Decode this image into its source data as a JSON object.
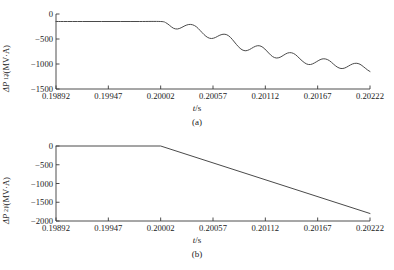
{
  "figure": {
    "panels": [
      {
        "id": "a",
        "caption": "(a)",
        "ylabel_prefix": "ΔP",
        "ylabel_sub": "12",
        "ylabel_suffix": "/(MV·A)",
        "xlabel_italic": "t",
        "xlabel_rest": "/s"
      },
      {
        "id": "b",
        "caption": "(b)",
        "ylabel_prefix": "ΔP",
        "ylabel_sub": "21",
        "ylabel_suffix": "/(MV·A)",
        "xlabel_italic": "t",
        "xlabel_rest": "/s"
      }
    ]
  },
  "chart_data": [
    {
      "type": "line",
      "panel": "a",
      "title": "",
      "xlabel": "t/s",
      "ylabel": "ΔP12/(MV·A)",
      "xlim": [
        0.19892,
        0.20222
      ],
      "ylim": [
        -1500,
        0
      ],
      "xticks": [
        "0.19892",
        "0.19947",
        "0.20002",
        "0.20057",
        "0.20112",
        "0.20167",
        "0.20222"
      ],
      "xtick_values": [
        0.19892,
        0.19947,
        0.20002,
        0.20057,
        0.20112,
        0.20167,
        0.20222
      ],
      "yticks": [
        "0",
        "-500",
        "-1000",
        "-1500"
      ],
      "ytick_values": [
        0,
        -500,
        -1000,
        -1500
      ],
      "grid": false,
      "legend": "none",
      "series": [
        {
          "name": "ΔP12",
          "description": "Flat at about -150 MV·A until t = 0.20002 s, then a damped oscillation superimposed on a downward ramp reaching about -1150 MV·A at t = 0.20222 s",
          "x": [
            0.19892,
            0.199,
            0.1992,
            0.1994,
            0.1996,
            0.1998,
            0.20002,
            0.200075,
            0.200115,
            0.200155,
            0.200195,
            0.200235,
            0.200275,
            0.200315,
            0.200355,
            0.200395,
            0.200435,
            0.200475,
            0.200515,
            0.200555,
            0.200595,
            0.200635,
            0.200675,
            0.200715,
            0.200755,
            0.200795,
            0.200835,
            0.200875,
            0.200915,
            0.200955,
            0.200995,
            0.201035,
            0.201075,
            0.201115,
            0.201155,
            0.201195,
            0.201235,
            0.201275,
            0.201315,
            0.201355,
            0.201395,
            0.201435,
            0.201475,
            0.201515,
            0.201555,
            0.201595,
            0.201635,
            0.201675,
            0.201715,
            0.201755,
            0.201795,
            0.201835,
            0.201875,
            0.201915,
            0.201955,
            0.201995,
            0.202035,
            0.202075,
            0.202115,
            0.202155,
            0.202195,
            0.20222
          ],
          "y": [
            -150,
            -150,
            -150,
            -150,
            -150,
            -150,
            -150,
            -175,
            -230,
            -285,
            -300,
            -275,
            -235,
            -210,
            -215,
            -255,
            -330,
            -410,
            -470,
            -490,
            -470,
            -430,
            -405,
            -415,
            -470,
            -560,
            -650,
            -715,
            -735,
            -710,
            -665,
            -635,
            -645,
            -700,
            -780,
            -850,
            -880,
            -865,
            -820,
            -780,
            -775,
            -810,
            -880,
            -950,
            -1000,
            -1010,
            -980,
            -935,
            -900,
            -900,
            -935,
            -1000,
            -1060,
            -1090,
            -1080,
            -1040,
            -1000,
            -985,
            -1005,
            -1060,
            -1120,
            -1150
          ]
        }
      ]
    },
    {
      "type": "line",
      "panel": "b",
      "title": "",
      "xlabel": "t/s",
      "ylabel": "ΔP21/(MV·A)",
      "xlim": [
        0.19892,
        0.20222
      ],
      "ylim": [
        -2000,
        0
      ],
      "xticks": [
        "0.19892",
        "0.19947",
        "0.20002",
        "0.20057",
        "0.20112",
        "0.20167",
        "0.20222"
      ],
      "xtick_values": [
        0.19892,
        0.19947,
        0.20002,
        0.20057,
        0.20112,
        0.20167,
        0.20222
      ],
      "yticks": [
        "0",
        "-500",
        "-1000",
        "-1500",
        "-2000"
      ],
      "ytick_values": [
        0,
        -500,
        -1000,
        -1500,
        -2000
      ],
      "grid": false,
      "legend": "none",
      "series": [
        {
          "name": "ΔP21",
          "description": "Flat at 0 MV·A until t = 0.20002 s, then a straight linear ramp down to about -1800 MV·A at t = 0.20222 s",
          "x": [
            0.19892,
            0.20002,
            0.20222
          ],
          "y": [
            0,
            0,
            -1800
          ]
        }
      ]
    }
  ]
}
